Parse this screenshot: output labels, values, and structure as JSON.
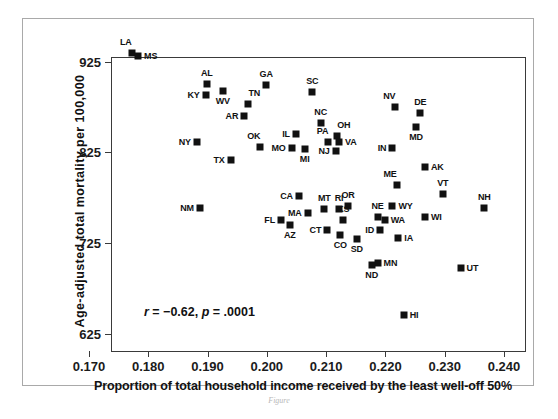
{
  "figure": {
    "caption": "Figure"
  },
  "chart_data": {
    "type": "scatter",
    "title": "",
    "xlabel": "Proportion of total household income received by the least well-off 50%",
    "ylabel": "Age-adjusted total mortality per 100,000",
    "xlim": [
      0.17,
      0.24
    ],
    "ylim": [
      625,
      950
    ],
    "grid": false,
    "legend": null,
    "xticks": [
      "0.170",
      "0.180",
      "0.190",
      "0.200",
      "0.210",
      "0.220",
      "0.230",
      "0.240"
    ],
    "xtick_values": [
      0.17,
      0.18,
      0.19,
      0.2,
      0.21,
      0.22,
      0.23,
      0.24
    ],
    "yticks": [
      "625",
      "725",
      "825",
      "925"
    ],
    "ytick_values": [
      625,
      725,
      825,
      925
    ],
    "annotation": {
      "r_prefix": "r",
      "r_text": " = −0.62, ",
      "p_prefix": "p",
      "p_text": " = .0001",
      "full_text": "r = −0.62, p = .0001"
    },
    "point_color": "#111111",
    "points": [
      {
        "label": "LA",
        "x": 0.1733,
        "y": 955,
        "lp": "above-left"
      },
      {
        "label": "MS",
        "x": 0.1744,
        "y": 952,
        "lp": "right"
      },
      {
        "label": "AL",
        "x": 0.186,
        "y": 921,
        "lp": "above"
      },
      {
        "label": "KY",
        "x": 0.1858,
        "y": 909,
        "lp": "left"
      },
      {
        "label": "WV",
        "x": 0.1887,
        "y": 914,
        "lp": "below"
      },
      {
        "label": "TN",
        "x": 0.193,
        "y": 899,
        "lp": "above-right"
      },
      {
        "label": "AR",
        "x": 0.1923,
        "y": 886,
        "lp": "left"
      },
      {
        "label": "GA",
        "x": 0.196,
        "y": 920,
        "lp": "above"
      },
      {
        "label": "SC",
        "x": 0.2038,
        "y": 913,
        "lp": "above"
      },
      {
        "label": "NV",
        "x": 0.2178,
        "y": 896,
        "lp": "above-left"
      },
      {
        "label": "DE",
        "x": 0.222,
        "y": 889,
        "lp": "above"
      },
      {
        "label": "MD",
        "x": 0.2213,
        "y": 874,
        "lp": "below"
      },
      {
        "label": "NC",
        "x": 0.2052,
        "y": 878,
        "lp": "above"
      },
      {
        "label": "OH",
        "x": 0.208,
        "y": 864,
        "lp": "above-right"
      },
      {
        "label": "IL",
        "x": 0.201,
        "y": 866,
        "lp": "left"
      },
      {
        "label": "PA",
        "x": 0.2065,
        "y": 858,
        "lp": "above-left"
      },
      {
        "label": "VA",
        "x": 0.2083,
        "y": 858,
        "lp": "right"
      },
      {
        "label": "NY",
        "x": 0.1843,
        "y": 858,
        "lp": "left"
      },
      {
        "label": "OK",
        "x": 0.195,
        "y": 852,
        "lp": "above-left"
      },
      {
        "label": "MO",
        "x": 0.2003,
        "y": 851,
        "lp": "left"
      },
      {
        "label": "MI",
        "x": 0.2025,
        "y": 850,
        "lp": "below"
      },
      {
        "label": "IN",
        "x": 0.2173,
        "y": 851,
        "lp": "left"
      },
      {
        "label": "NJ",
        "x": 0.2077,
        "y": 847,
        "lp": "left"
      },
      {
        "label": "TX",
        "x": 0.19,
        "y": 838,
        "lp": "left"
      },
      {
        "label": "AK",
        "x": 0.2228,
        "y": 830,
        "lp": "right"
      },
      {
        "label": "ME",
        "x": 0.218,
        "y": 810,
        "lp": "above-left"
      },
      {
        "label": "VT",
        "x": 0.2258,
        "y": 800,
        "lp": "above"
      },
      {
        "label": "CA",
        "x": 0.2015,
        "y": 798,
        "lp": "left"
      },
      {
        "label": "OR",
        "x": 0.2098,
        "y": 787,
        "lp": "above"
      },
      {
        "label": "RI",
        "x": 0.2083,
        "y": 784,
        "lp": "above"
      },
      {
        "label": "MT",
        "x": 0.2058,
        "y": 784,
        "lp": "above"
      },
      {
        "label": "WY",
        "x": 0.2173,
        "y": 787,
        "lp": "right"
      },
      {
        "label": "NH",
        "x": 0.2328,
        "y": 785,
        "lp": "above"
      },
      {
        "label": "NM",
        "x": 0.1848,
        "y": 785,
        "lp": "left"
      },
      {
        "label": "MA",
        "x": 0.203,
        "y": 779,
        "lp": "left"
      },
      {
        "label": "KS",
        "x": 0.209,
        "y": 772,
        "lp": "above"
      },
      {
        "label": "NE",
        "x": 0.2148,
        "y": 775,
        "lp": "above"
      },
      {
        "label": "WA",
        "x": 0.216,
        "y": 772,
        "lp": "right"
      },
      {
        "label": "WI",
        "x": 0.2228,
        "y": 775,
        "lp": "right"
      },
      {
        "label": "FL",
        "x": 0.1985,
        "y": 772,
        "lp": "left"
      },
      {
        "label": "AZ",
        "x": 0.2,
        "y": 766,
        "lp": "below"
      },
      {
        "label": "CT",
        "x": 0.2063,
        "y": 761,
        "lp": "left"
      },
      {
        "label": "ID",
        "x": 0.2152,
        "y": 760,
        "lp": "left"
      },
      {
        "label": "CO",
        "x": 0.2085,
        "y": 755,
        "lp": "below"
      },
      {
        "label": "SD",
        "x": 0.2113,
        "y": 751,
        "lp": "below"
      },
      {
        "label": "IA",
        "x": 0.2183,
        "y": 752,
        "lp": "right"
      },
      {
        "label": "MN",
        "x": 0.2148,
        "y": 724,
        "lp": "right"
      },
      {
        "label": "ND",
        "x": 0.2138,
        "y": 722,
        "lp": "below"
      },
      {
        "label": "UT",
        "x": 0.2288,
        "y": 719,
        "lp": "right"
      },
      {
        "label": "HI",
        "x": 0.2192,
        "y": 667,
        "lp": "right"
      }
    ]
  }
}
